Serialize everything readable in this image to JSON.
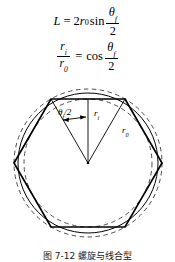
{
  "figure": {
    "equations": [
      {
        "id": "chord-length",
        "lhs": "L",
        "relation": "=",
        "coefficient": "2",
        "variable": "r",
        "variable_subscript": "0",
        "function": "sin",
        "fraction_numerator_symbol": "θ",
        "fraction_numerator_subscript": "f",
        "fraction_denominator": "2",
        "plain_text": "L = 2r0 sin(θf/2)"
      },
      {
        "id": "radius-ratio",
        "lhs_numerator_symbol": "r",
        "lhs_numerator_subscript": "i",
        "lhs_denominator_symbol": "r",
        "lhs_denominator_subscript": "0",
        "relation": "=",
        "function": "cos",
        "fraction_numerator_symbol": "θ",
        "fraction_numerator_subscript": "f",
        "fraction_denominator": "2",
        "plain_text": "ri / r0 = cos(θf/2)"
      }
    ],
    "diagram": {
      "type": "geometric-construction",
      "description": "Regular hexagon inscribed between dashed inner and outer circles with radii marked from the center",
      "labels": {
        "angle": {
          "symbol": "θ",
          "subscript": "f",
          "divisor": "/2",
          "plain_text": "θf/2"
        },
        "inner_radius": {
          "symbol": "r",
          "subscript": "i",
          "plain_text": "ri"
        },
        "outer_radius": {
          "symbol": "r",
          "subscript": "0",
          "plain_text": "r0"
        }
      },
      "geometry": {
        "center_x": 88,
        "center_y": 85,
        "outer_radius_px": 74,
        "inner_radius_px": 64,
        "polygon_sides": 6,
        "polygon_orientation": "flat-top"
      },
      "colors": {
        "stroke": "#000000",
        "dashed_stroke": "#555555",
        "background": "#ffffff"
      }
    },
    "caption": {
      "text": "图 7-12  螺旋与线合型",
      "note": "clipped at image bottom edge"
    }
  }
}
